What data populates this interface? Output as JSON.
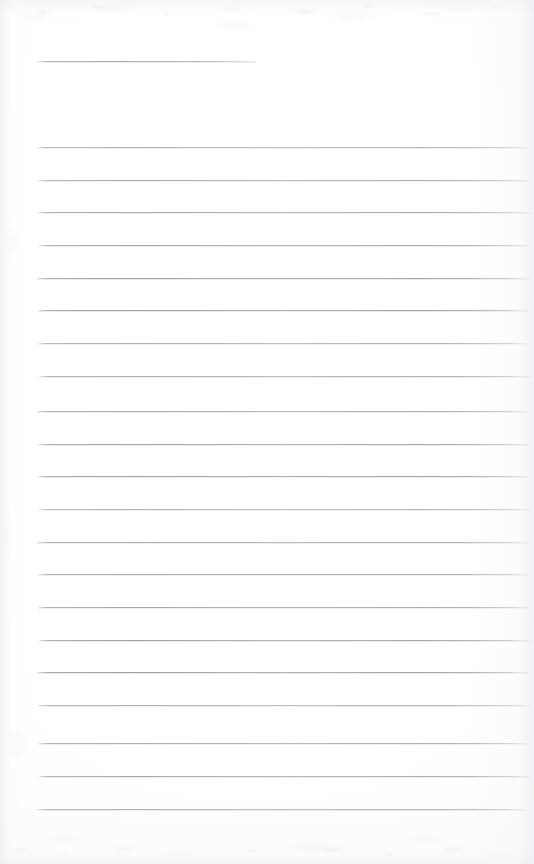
{
  "document": {
    "kind": "scanned-lined-notepad-page",
    "title": "",
    "page_text": "",
    "visible_text": "",
    "handwriting": "",
    "page_number": "",
    "canvas": {
      "width": 534,
      "height": 864
    },
    "colors": {
      "paper": "#fefeff",
      "paper_edge_shadow": "#eeeef2",
      "rule_line": "#a8a8b0",
      "rule_line_faded": "#c6c6ce"
    }
  },
  "ruling": {
    "header_rule": {
      "label": "header-entry-rule",
      "x_start": 37,
      "x_end": 256,
      "y": 61,
      "length": 219,
      "thickness": 1
    },
    "body_rules": {
      "label": "body-ruled-lines",
      "count": 21,
      "x_start": 38,
      "x_end": 529,
      "first_y": 147,
      "spacing": 32.7,
      "thickness": 1,
      "y_positions": [
        147,
        180,
        212,
        245,
        278,
        310,
        343,
        376,
        411,
        444,
        476,
        509,
        542,
        574,
        607,
        640,
        672,
        705,
        743,
        776,
        809
      ]
    },
    "margins": {
      "top_blank": 61,
      "left": 38,
      "right": 5,
      "bottom_blank": 55
    }
  }
}
